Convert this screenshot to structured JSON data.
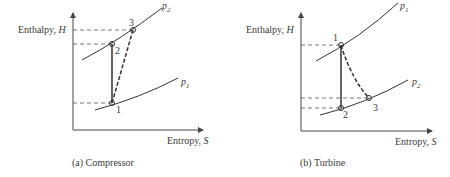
{
  "panels": [
    {
      "id": "a",
      "caption": "(a) Compressor",
      "ylabel": "Enthalpy, ",
      "ylabel_var": "H",
      "xlabel": "Entropy, ",
      "xlabel_var": "S",
      "curves": [
        {
          "label": "p",
          "sub": "2"
        },
        {
          "label": "p",
          "sub": "1"
        }
      ],
      "points": [
        "1",
        "2",
        "3"
      ]
    },
    {
      "id": "b",
      "caption": "(b) Turbine",
      "ylabel": "Enthalpy, ",
      "ylabel_var": "H",
      "xlabel": "Entropy, ",
      "xlabel_var": "S",
      "curves": [
        {
          "label": "p",
          "sub": "1"
        },
        {
          "label": "p",
          "sub": "2"
        }
      ],
      "points": [
        "1",
        "2",
        "3"
      ]
    }
  ]
}
